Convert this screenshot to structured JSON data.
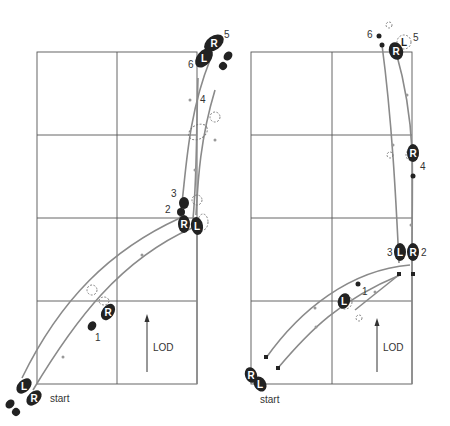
{
  "diagrams": [
    {
      "id": "left",
      "start_label": "start",
      "direction_label": "LOD",
      "foot_letters": {
        "start_L": "L",
        "start_R": "R",
        "step1_R": "R",
        "step2_R": "R",
        "step2_L": "L",
        "step5_R": "R",
        "step6_L": "L"
      },
      "step_numbers": [
        "1",
        "2",
        "3",
        "4",
        "5",
        "6"
      ]
    },
    {
      "id": "right",
      "start_label": "start",
      "direction_label": "LOD",
      "foot_letters": {
        "start_R": "R",
        "start_L": "L",
        "step1_L": "L",
        "step2_R": "R",
        "step3_L": "L",
        "step4_R": "R",
        "step5_R": "R",
        "step5_L": "L"
      },
      "step_numbers": [
        "1",
        "2",
        "3",
        "4",
        "5",
        "6"
      ]
    }
  ],
  "colors": {
    "footprint": "#222222",
    "path": "#8a8a8a",
    "grid": "#555555"
  }
}
